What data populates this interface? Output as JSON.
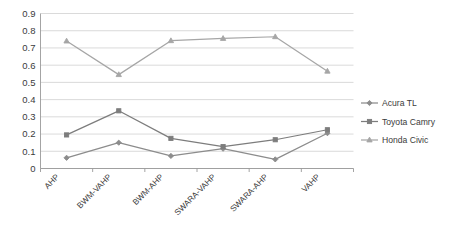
{
  "chart_data": {
    "type": "line",
    "title": "",
    "xlabel": "",
    "ylabel": "",
    "categories": [
      "AHP",
      "BWM-VAHP",
      "BWM-AHP",
      "SWARA-VAHP",
      "SWARA-AHP",
      "VAHP"
    ],
    "series": [
      {
        "name": "Acura TL",
        "marker": "diamond",
        "color": "#8c8c8c",
        "values": [
          0.062,
          0.15,
          0.073,
          0.115,
          0.053,
          0.205
        ]
      },
      {
        "name": "Toyota Camry",
        "marker": "square",
        "color": "#7d7d7d",
        "values": [
          0.195,
          0.335,
          0.175,
          0.127,
          0.167,
          0.225
        ]
      },
      {
        "name": "Honda Civic",
        "marker": "triangle",
        "color": "#a6a6a6",
        "values": [
          0.74,
          0.545,
          0.742,
          0.755,
          0.765,
          0.565
        ]
      }
    ],
    "ylim": [
      0,
      0.9
    ],
    "ytick_labels": [
      "0.9",
      "0.8",
      "0.7",
      "0.6",
      "0.5",
      "0.4",
      "0.3",
      "0.2",
      "0.1",
      "0"
    ],
    "ytick_values": [
      0.9,
      0.8,
      0.7,
      0.6,
      0.5,
      0.4,
      0.3,
      0.2,
      0.1,
      0
    ],
    "grid": true,
    "legend_position": "right"
  },
  "legend": {
    "entries": [
      {
        "label": "Acura TL"
      },
      {
        "label": "Toyota Camry"
      },
      {
        "label": "Honda Civic"
      }
    ]
  },
  "colors": {
    "gridline": "#d0d0d0",
    "axis": "#9a9a9a",
    "text": "#3b3b3b",
    "background": "#ffffff"
  }
}
